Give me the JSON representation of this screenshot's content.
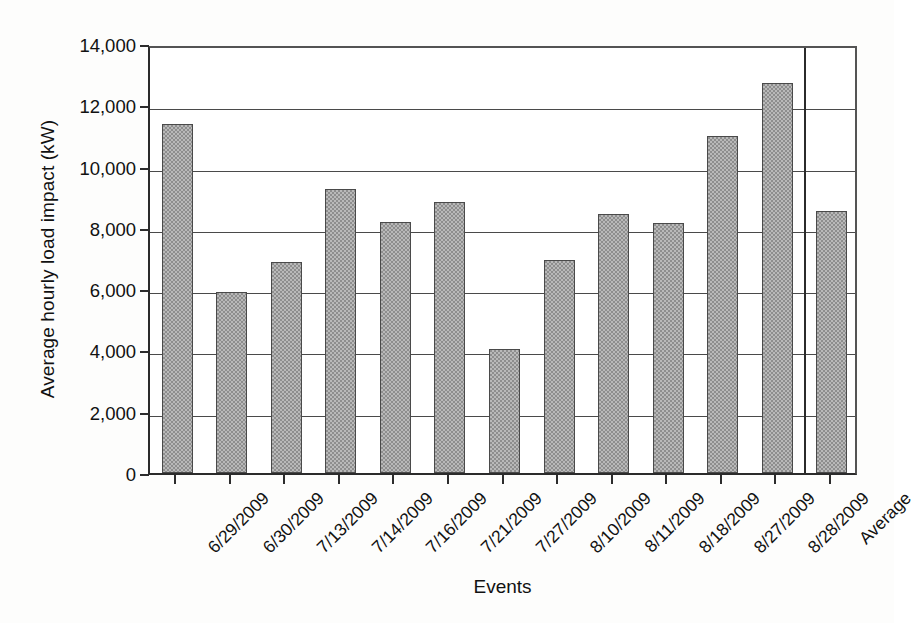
{
  "chart_data": {
    "type": "bar",
    "title": "",
    "xlabel": "Events",
    "ylabel": "Average hourly load impact (kW)",
    "categories": [
      "6/29/2009",
      "6/30/2009",
      "7/13/2009",
      "7/14/2009",
      "7/16/2009",
      "7/21/2009",
      "7/27/2009",
      "8/10/2009",
      "8/11/2009",
      "8/18/2009",
      "8/27/2009",
      "8/28/2009",
      "Average"
    ],
    "values": [
      11400,
      5900,
      6900,
      9280,
      8200,
      8850,
      4050,
      6940,
      8450,
      8150,
      11000,
      12720,
      8550
    ],
    "ylim": [
      0,
      14000
    ],
    "ytick_labels": [
      "0",
      "2,000",
      "4,000",
      "6,000",
      "8,000",
      "10,000",
      "12,000",
      "14,000"
    ],
    "ytick_values": [
      0,
      2000,
      4000,
      6000,
      8000,
      10000,
      12000,
      14000
    ],
    "grid": "horizontal",
    "legend": "none",
    "bar_color": "#8e8e8e",
    "bar_edge_color": "#4a4a4a",
    "axis_color": "#2b2b2b",
    "separator_before": "Average"
  }
}
